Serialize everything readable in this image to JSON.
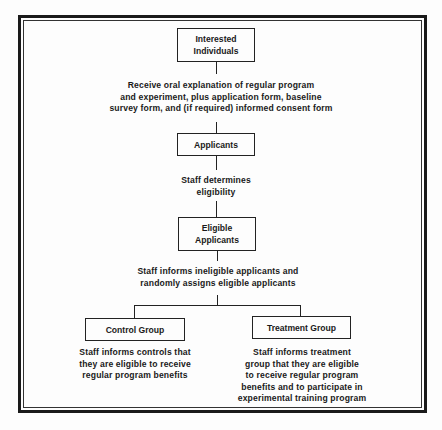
{
  "diagram": {
    "type": "flowchart",
    "nodes": [
      {
        "id": "interested",
        "label": "Interested\nIndividuals"
      },
      {
        "id": "applicants",
        "label": "Applicants"
      },
      {
        "id": "eligible",
        "label": "Eligible\nApplicants"
      },
      {
        "id": "control",
        "label": "Control Group"
      },
      {
        "id": "treatment",
        "label": "Treatment Group"
      }
    ],
    "steps": {
      "step1": "Receive oral explanation of regular program\nand experiment, plus application form, baseline\nsurvey form, and (if required) informed consent form",
      "step2": "Staff determines\neligibility",
      "step3": "Staff informs ineligible applicants and\nrandomly assigns eligible applicants",
      "control_note": "Staff informs controls that\nthey are eligible to receive\nregular program benefits",
      "treatment_note": "Staff informs treatment\ngroup that they are eligible\nto receive regular program\nbenefits and to participate in\nexperimental training program"
    },
    "edges": [
      {
        "from": "interested",
        "to": "applicants"
      },
      {
        "from": "applicants",
        "to": "eligible"
      },
      {
        "from": "eligible",
        "to": "control"
      },
      {
        "from": "eligible",
        "to": "treatment"
      }
    ]
  }
}
